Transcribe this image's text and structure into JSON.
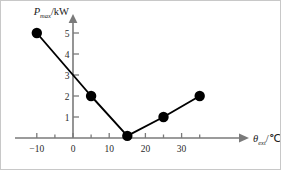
{
  "chart_data": {
    "type": "line",
    "title": "",
    "subtitle": "",
    "xlabel": "θ",
    "xlabel_sub": "ext",
    "xlabel_unit": "/℃",
    "ylabel": "P",
    "ylabel_sub": "max",
    "ylabel_unit": "/kW",
    "x": [
      -10,
      5,
      15,
      25,
      35
    ],
    "values": [
      5,
      2,
      0.1,
      1,
      2
    ],
    "series": [
      {
        "name": "P_max",
        "x": [
          -10,
          5,
          15,
          25,
          35
        ],
        "values": [
          5,
          2,
          0.1,
          1,
          2
        ]
      }
    ],
    "xlim": [
      -14,
      40
    ],
    "ylim": [
      0,
      5.7
    ],
    "xticks": [
      -10,
      -5,
      0,
      5,
      10,
      15,
      20,
      25,
      30,
      35
    ],
    "xticklabels": [
      "−10",
      "",
      "0",
      "",
      "10",
      "",
      "20",
      "",
      "30",
      ""
    ],
    "yticks": [
      1,
      2,
      3,
      4,
      5
    ],
    "yticklabels": [
      "1",
      "2",
      "3",
      "4",
      "5"
    ],
    "grid": false,
    "legend": false,
    "legend_position": "none",
    "marker": "filled-circle",
    "line_color": "#000000",
    "marker_color": "#000000",
    "axis_color": "#7a7a7a",
    "background_color": "#ffffff",
    "annotations": []
  },
  "axes": {
    "x_arrow": "arrow-right",
    "y_arrow": "arrow-up"
  }
}
